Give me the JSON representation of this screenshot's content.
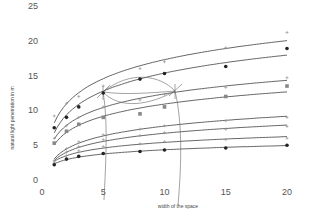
{
  "chart_data": {
    "type": "scatter",
    "title": "",
    "xlabel": "width of the space",
    "ylabel": "natural light penetration in m",
    "xlim": [
      0,
      20
    ],
    "ylim": [
      0,
      25
    ],
    "x_ticks": [
      "0",
      "5",
      "10",
      "15",
      "20"
    ],
    "y_ticks": [
      "0",
      "5",
      "10",
      "15",
      "20",
      "25"
    ],
    "grid": false,
    "legend": null,
    "x": [
      1,
      2,
      3,
      5,
      8,
      10,
      15,
      20
    ],
    "series": [
      {
        "name": "upper-1 (plus markers)",
        "marker": "plus",
        "values": [
          9.2,
          11.0,
          12.0,
          13.5,
          16.0,
          17.0,
          19.0,
          21.2
        ]
      },
      {
        "name": "upper-2 (filled circles)",
        "marker": "circle",
        "values": [
          7.5,
          9.0,
          10.5,
          12.5,
          14.5,
          15.3,
          16.3,
          18.9
        ]
      },
      {
        "name": "upper-3 (plus markers)",
        "marker": "plus",
        "values": [
          6.0,
          7.8,
          9.0,
          10.5,
          11.5,
          12.3,
          13.3,
          14.7
        ]
      },
      {
        "name": "upper-4 (gray squares)",
        "marker": "square",
        "values": [
          5.3,
          7.0,
          8.0,
          9.0,
          9.5,
          10.5,
          12.0,
          13.5
        ]
      },
      {
        "name": "lower-1 (plus markers)",
        "marker": "plus",
        "values": [
          2.8,
          4.5,
          5.5,
          6.5,
          7.3,
          7.8,
          8.5,
          9.0
        ]
      },
      {
        "name": "lower-2 (plus markers)",
        "marker": "plus",
        "values": [
          2.6,
          4.0,
          4.8,
          5.8,
          6.4,
          6.8,
          7.3,
          7.7
        ]
      },
      {
        "name": "lower-3 (small markers)",
        "marker": "plus",
        "values": [
          2.4,
          3.5,
          4.2,
          4.8,
          5.2,
          5.5,
          5.8,
          6.0
        ]
      },
      {
        "name": "lower-4 (filled circles)",
        "marker": "circle",
        "values": [
          2.2,
          3.0,
          3.4,
          3.8,
          4.1,
          4.3,
          4.6,
          5.0
        ]
      }
    ],
    "annotations": [
      {
        "type": "arc-arrows",
        "description": "radiating arrows from point near (5, 12.5) to point near (11.2, 12.8), with a vertical arc line near x=5 and x=11"
      }
    ]
  }
}
